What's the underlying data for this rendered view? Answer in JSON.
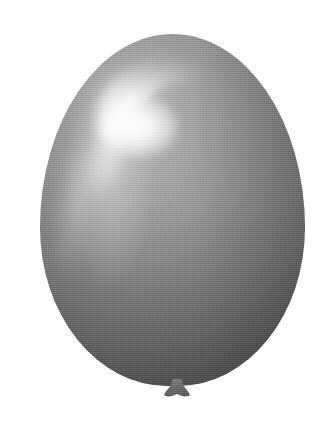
{
  "image": {
    "subject": "balloon",
    "description": "Grayscale photograph of a single inflated latex party balloon, seen from the front against a plain white background.",
    "orientation": "portrait",
    "width_px": 330,
    "height_px": 422,
    "background_color": "#ffffff",
    "color_mode": "grayscale",
    "texture": "fine halftone print grain"
  },
  "balloon": {
    "label": "balloon",
    "body_label": "balloon-body",
    "shape": "teardrop / oval",
    "bounds": {
      "left_px": 40,
      "top_px": 34,
      "width_px": 265,
      "height_px": 352,
      "center_x_px": 172,
      "widest_y_px": 200
    },
    "colors": {
      "body_light": "#b9b9b9",
      "body_mid": "#8e8e8e",
      "body_dark": "#6a6a6a",
      "edge_shadow": "#5a5a5a",
      "knot": "#6d6d6d",
      "highlight": "#f7f7f7"
    }
  },
  "highlight": {
    "label": "specular-highlight",
    "shape": "crescent",
    "position": "upper-left",
    "core": {
      "x_px": 146,
      "y_px": 127,
      "width_px": 74,
      "height_px": 62
    },
    "arc_extends_to": "upper-right",
    "tail_direction": "down-left"
  },
  "knot": {
    "label": "balloon-knot",
    "shape": "trapezoid flare",
    "position": "bottom-center",
    "bounds": {
      "left_px": 163,
      "top_px": 379,
      "width_px": 28,
      "height_px": 19
    }
  }
}
